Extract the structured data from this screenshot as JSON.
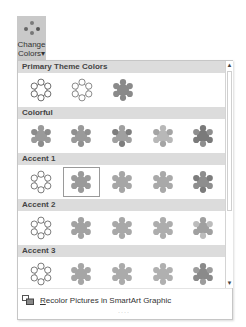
{
  "ribbon": {
    "change_colors": {
      "line1": "Change",
      "line2": "Colors",
      "caret": "▾",
      "icon": "dots-icon"
    }
  },
  "gallery": {
    "sections": [
      {
        "title": "Primary Theme Colors",
        "items": [
          {
            "style": "outline",
            "fill": "#ffffff",
            "stroke": "#555555"
          },
          {
            "style": "outline",
            "fill": "#ffffff",
            "stroke": "#777777"
          },
          {
            "style": "filled",
            "fill": "#8a8a8a",
            "stroke": "#8a8a8a"
          }
        ]
      },
      {
        "title": "Colorful",
        "items": [
          {
            "style": "multi",
            "fill": "#9a9a9a",
            "petals": "#8c8c8c"
          },
          {
            "style": "multi",
            "fill": "#9a9a9a",
            "petals": "#909090"
          },
          {
            "style": "multi",
            "fill": "#a0a0a0",
            "petals": "#7e7e7e"
          },
          {
            "style": "multi",
            "fill": "#b8b8b8",
            "petals": "#a4a4a4"
          },
          {
            "style": "multi",
            "fill": "#7a7a7a",
            "petals": "#8e8e8e"
          }
        ]
      },
      {
        "title": "Accent 1",
        "items": [
          {
            "style": "outline",
            "fill": "#ffffff",
            "stroke": "#666666"
          },
          {
            "style": "filled",
            "fill": "#9a9a9a",
            "stroke": "#9a9a9a",
            "selected": true
          },
          {
            "style": "filled",
            "fill": "#a6a6a6",
            "stroke": "#a6a6a6"
          },
          {
            "style": "filled",
            "fill": "#a9a9a9",
            "stroke": "#a9a9a9"
          },
          {
            "style": "multi",
            "fill": "#8e8e8e",
            "petals": "#7c7c7c"
          }
        ]
      },
      {
        "title": "Accent 2",
        "items": [
          {
            "style": "outline",
            "fill": "#ffffff",
            "stroke": "#666666"
          },
          {
            "style": "filled",
            "fill": "#a2a2a2",
            "stroke": "#a2a2a2"
          },
          {
            "style": "filled",
            "fill": "#a8a8a8",
            "stroke": "#a8a8a8"
          },
          {
            "style": "filled",
            "fill": "#adadad",
            "stroke": "#adadad"
          },
          {
            "style": "multi",
            "fill": "#a0a0a0",
            "petals": "#bcbcbc"
          }
        ]
      },
      {
        "title": "Accent 3",
        "items": [
          {
            "style": "outline",
            "fill": "#ffffff",
            "stroke": "#666666"
          },
          {
            "style": "filled",
            "fill": "#a6a6a6",
            "stroke": "#a6a6a6"
          },
          {
            "style": "filled",
            "fill": "#ababab",
            "stroke": "#ababab"
          },
          {
            "style": "filled",
            "fill": "#b0b0b0",
            "stroke": "#b0b0b0"
          },
          {
            "style": "multi",
            "fill": "#8a8a8a",
            "petals": "#9c9c9c"
          }
        ]
      }
    ]
  },
  "scrollbar": {
    "up": "▲",
    "down": "▼"
  },
  "footer": {
    "recolor_accel": "R",
    "recolor_rest": "ecolor Pictures in SmartArt Graphic",
    "grip": "····"
  }
}
